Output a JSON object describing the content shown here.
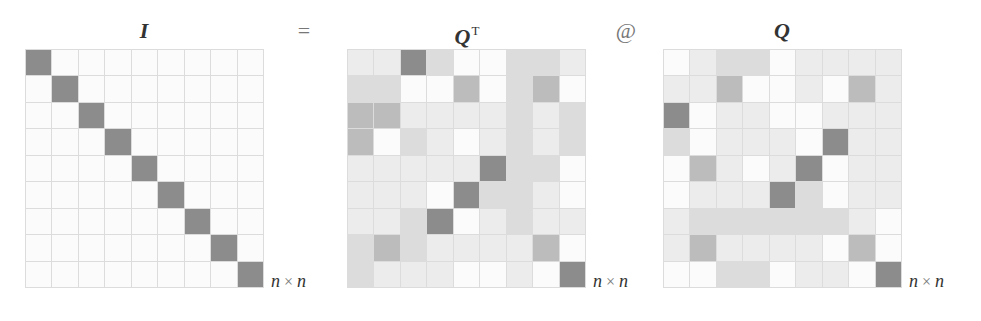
{
  "diagram": {
    "equation": {
      "lhs_title": "I",
      "equals": "=",
      "factor1_title": "Q",
      "factor1_superscript": "T",
      "operator": "@",
      "factor2_title": "Q"
    },
    "dimension_label": {
      "var1": "n",
      "times": "×",
      "var2": "n"
    },
    "shade_palette": {
      "0": "#fbfbfb",
      "1": "#ececec",
      "2": "#dcdcdc",
      "3": "#bcbcbc",
      "4": "#8c8c8c"
    },
    "matrices": [
      {
        "name": "identity",
        "left": 25,
        "shades": [
          [
            4,
            0,
            0,
            0,
            0,
            0,
            0,
            0,
            0
          ],
          [
            0,
            4,
            0,
            0,
            0,
            0,
            0,
            0,
            0
          ],
          [
            0,
            0,
            4,
            0,
            0,
            0,
            0,
            0,
            0
          ],
          [
            0,
            0,
            0,
            4,
            0,
            0,
            0,
            0,
            0
          ],
          [
            0,
            0,
            0,
            0,
            4,
            0,
            0,
            0,
            0
          ],
          [
            0,
            0,
            0,
            0,
            0,
            4,
            0,
            0,
            0
          ],
          [
            0,
            0,
            0,
            0,
            0,
            0,
            4,
            0,
            0
          ],
          [
            0,
            0,
            0,
            0,
            0,
            0,
            0,
            4,
            0
          ],
          [
            0,
            0,
            0,
            0,
            0,
            0,
            0,
            0,
            4
          ]
        ]
      },
      {
        "name": "q-transpose",
        "left": 347,
        "shades": [
          [
            1,
            1,
            4,
            2,
            0,
            0,
            2,
            2,
            1
          ],
          [
            2,
            2,
            0,
            0,
            3,
            0,
            2,
            3,
            0
          ],
          [
            3,
            3,
            1,
            1,
            1,
            1,
            2,
            1,
            2
          ],
          [
            3,
            0,
            2,
            1,
            0,
            1,
            2,
            1,
            2
          ],
          [
            1,
            1,
            1,
            1,
            1,
            4,
            2,
            2,
            0
          ],
          [
            1,
            1,
            1,
            0,
            4,
            2,
            2,
            1,
            0
          ],
          [
            1,
            1,
            2,
            4,
            0,
            1,
            2,
            1,
            1
          ],
          [
            2,
            3,
            2,
            1,
            1,
            1,
            1,
            3,
            0
          ],
          [
            2,
            1,
            1,
            1,
            0,
            0,
            1,
            0,
            4
          ]
        ]
      },
      {
        "name": "q",
        "left": 663,
        "shades": [
          [
            0,
            1,
            2,
            2,
            0,
            1,
            1,
            1,
            1
          ],
          [
            1,
            1,
            3,
            0,
            0,
            1,
            0,
            3,
            1
          ],
          [
            4,
            0,
            1,
            1,
            0,
            0,
            1,
            1,
            1
          ],
          [
            2,
            0,
            1,
            1,
            1,
            0,
            4,
            1,
            1
          ],
          [
            0,
            3,
            1,
            0,
            1,
            4,
            0,
            1,
            1
          ],
          [
            0,
            1,
            1,
            1,
            4,
            2,
            0,
            1,
            1
          ],
          [
            1,
            2,
            2,
            2,
            2,
            2,
            2,
            1,
            0
          ],
          [
            1,
            3,
            1,
            1,
            1,
            1,
            0,
            3,
            0
          ],
          [
            0,
            0,
            2,
            2,
            0,
            1,
            1,
            0,
            4
          ]
        ]
      }
    ]
  }
}
